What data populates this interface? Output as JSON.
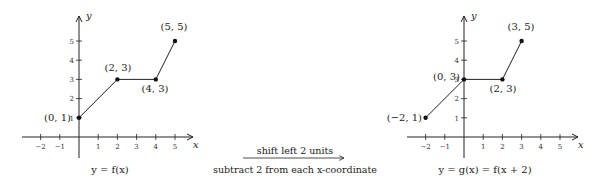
{
  "left_graph": {
    "caption": "y = f(x)",
    "x_label": "x",
    "y_label": "y",
    "x_ticks": [
      "−2",
      "−1",
      "1",
      "2",
      "3",
      "4",
      "5"
    ],
    "y_ticks": [
      "1",
      "2",
      "3",
      "4",
      "5"
    ],
    "points": [
      {
        "label": "(0, 1)",
        "x": 0,
        "y": 1
      },
      {
        "label": "(2, 3)",
        "x": 2,
        "y": 3
      },
      {
        "label": "(4, 3)",
        "x": 4,
        "y": 3
      },
      {
        "label": "(5, 5)",
        "x": 5,
        "y": 5
      }
    ]
  },
  "transform": {
    "top_label": "shift left 2 units",
    "bottom_label": "subtract 2 from each x-coordinate"
  },
  "right_graph": {
    "caption": "y = g(x) = f(x + 2)",
    "x_label": "x",
    "y_label": "y",
    "x_ticks": [
      "−2",
      "−1",
      "1",
      "2",
      "3",
      "4",
      "5"
    ],
    "y_ticks": [
      "1",
      "2",
      "3",
      "4",
      "5"
    ],
    "points": [
      {
        "label": "(−2, 1)",
        "x": -2,
        "y": 1
      },
      {
        "label": "(0, 3)",
        "x": 0,
        "y": 3
      },
      {
        "label": "(2, 3)",
        "x": 2,
        "y": 3
      },
      {
        "label": "(3, 5)",
        "x": 3,
        "y": 5
      }
    ]
  }
}
